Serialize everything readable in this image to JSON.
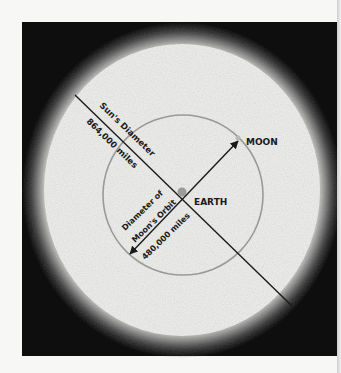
{
  "figure": {
    "sun": {
      "label": "Sun's Diameter",
      "value": "864,000 miles"
    },
    "orbit": {
      "label_line1": "Diameter of",
      "label_line2": "Moon's Orbit",
      "value": "480,000 miles"
    },
    "earth": {
      "label": "EARTH"
    },
    "moon": {
      "label": "MOON"
    },
    "colors": {
      "space": "#0e0e0e",
      "sun": "#eeeeec",
      "orbit_ring": "#9a9a9a",
      "earth_dot": "#9b9b9b",
      "moon_dot": "#b8b8b8",
      "line": "#1a1a1a"
    }
  }
}
